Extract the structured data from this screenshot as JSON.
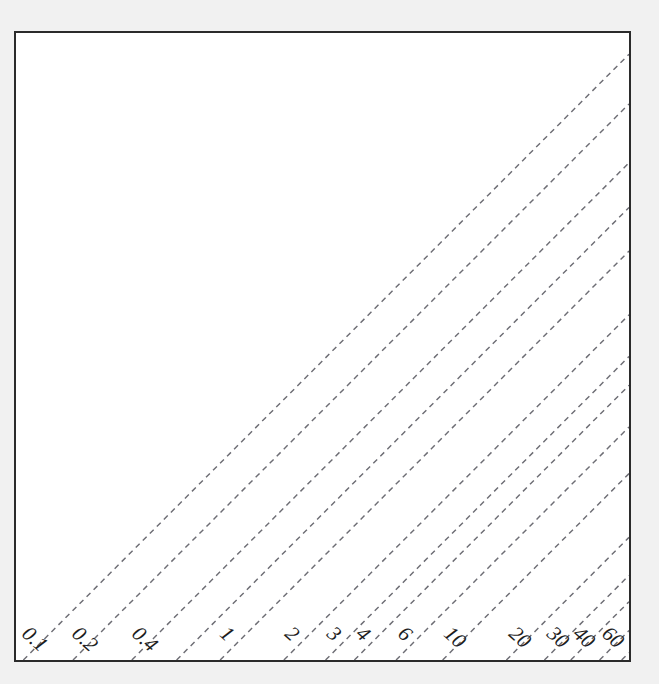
{
  "figure": {
    "background_color": "#f1f1f1",
    "plot_background_color": "#ffffff",
    "frame_color": "#2b2b2b",
    "line_color": "#6d6d74"
  },
  "chart_data": {
    "type": "line",
    "title": "",
    "subtitle": "",
    "xlabel": "",
    "ylabel": "",
    "xlim": [
      0,
      1
    ],
    "ylim": [
      0,
      1
    ],
    "grid": false,
    "legend": "none",
    "annotations": [],
    "tick_labels_x": [],
    "tick_labels_y": [],
    "contours": [
      {
        "label": "0.1",
        "value": 0.1,
        "x_at_bottom": 0.012,
        "slope": 1.0,
        "label_x": 0.012,
        "label_y": 0.0,
        "label_rotation": 42
      },
      {
        "label": "0.2",
        "value": 0.2,
        "x_at_bottom": 0.093,
        "slope": 1.0,
        "label_x": 0.093,
        "label_y": 0.0,
        "label_rotation": 42
      },
      {
        "label": "0.4",
        "value": 0.4,
        "x_at_bottom": 0.189,
        "slope": 1.0,
        "label_x": 0.189,
        "label_y": 0.0,
        "label_rotation": 42
      },
      {
        "label": "",
        "value": 0.6,
        "x_at_bottom": 0.262,
        "slope": 1.0,
        "label_x": null,
        "label_y": null,
        "label_rotation": 42
      },
      {
        "label": "1",
        "value": 1,
        "x_at_bottom": 0.333,
        "slope": 1.0,
        "label_x": 0.333,
        "label_y": 0.0,
        "label_rotation": 42
      },
      {
        "label": "2",
        "value": 2,
        "x_at_bottom": 0.437,
        "slope": 1.0,
        "label_x": 0.437,
        "label_y": 0.0,
        "label_rotation": 42
      },
      {
        "label": "3",
        "value": 3,
        "x_at_bottom": 0.505,
        "slope": 1.0,
        "label_x": 0.505,
        "label_y": 0.0,
        "label_rotation": 42
      },
      {
        "label": "4",
        "value": 4,
        "x_at_bottom": 0.552,
        "slope": 1.0,
        "label_x": 0.552,
        "label_y": 0.0,
        "label_rotation": 42
      },
      {
        "label": "6",
        "value": 6,
        "x_at_bottom": 0.62,
        "slope": 1.0,
        "label_x": 0.62,
        "label_y": 0.0,
        "label_rotation": 42
      },
      {
        "label": "10",
        "value": 10,
        "x_at_bottom": 0.696,
        "slope": 1.0,
        "label_x": 0.696,
        "label_y": 0.0,
        "label_rotation": 42
      },
      {
        "label": "20",
        "value": 20,
        "x_at_bottom": 0.8,
        "slope": 1.0,
        "label_x": 0.8,
        "label_y": 0.0,
        "label_rotation": 42
      },
      {
        "label": "30",
        "value": 30,
        "x_at_bottom": 0.862,
        "slope": 1.0,
        "label_x": 0.862,
        "label_y": 0.0,
        "label_rotation": 42
      },
      {
        "label": "40",
        "value": 40,
        "x_at_bottom": 0.905,
        "slope": 1.0,
        "label_x": 0.905,
        "label_y": 0.0,
        "label_rotation": 42
      },
      {
        "label": "60",
        "value": 60,
        "x_at_bottom": 0.952,
        "slope": 1.0,
        "label_x": 0.952,
        "label_y": 0.0,
        "label_rotation": 42
      },
      {
        "label": "",
        "value": 100,
        "x_at_bottom": 0.988,
        "slope": 1.0,
        "label_x": null,
        "label_y": null,
        "label_rotation": 42
      }
    ]
  }
}
